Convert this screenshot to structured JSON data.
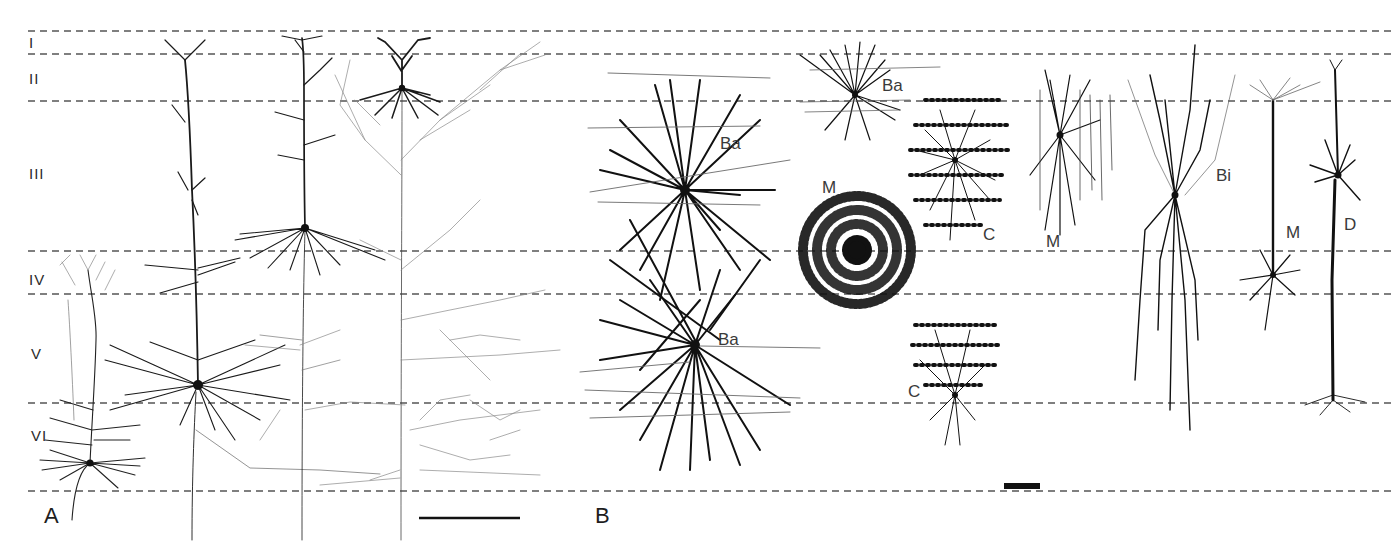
{
  "figure": {
    "layers": [
      {
        "label": "I",
        "top": 31,
        "bottom": 54
      },
      {
        "label": "II",
        "top": 54,
        "bottom": 101
      },
      {
        "label": "III",
        "top": 101,
        "bottom": 251
      },
      {
        "label": "IV",
        "top": 251,
        "bottom": 294
      },
      {
        "label": "V",
        "top": 294,
        "bottom": 403
      },
      {
        "label": "VI",
        "top": 403,
        "bottom": 491
      }
    ],
    "layer_boundaries_y": [
      31,
      54,
      101,
      251,
      294,
      403,
      491
    ],
    "panels": [
      {
        "label": "A",
        "content": "Pyramidal and spiny neurons spanning layers"
      },
      {
        "label": "B",
        "content": "Non-pyramidal interneuron types"
      }
    ],
    "cell_labels": [
      {
        "id": "ba-1",
        "text": "Ba",
        "x": 852,
        "y": 64
      },
      {
        "id": "ba-2",
        "text": "Ba",
        "x": 718,
        "y": 134
      },
      {
        "id": "ba-3",
        "text": "Ba",
        "x": 718,
        "y": 330
      },
      {
        "id": "m-1",
        "text": "M",
        "x": 822,
        "y": 178
      },
      {
        "id": "c-1",
        "text": "C",
        "x": 983,
        "y": 224
      },
      {
        "id": "m-2",
        "text": "M",
        "x": 1046,
        "y": 232
      },
      {
        "id": "bi-1",
        "text": "Bi",
        "x": 1216,
        "y": 166
      },
      {
        "id": "m-3",
        "text": "M",
        "x": 1286,
        "y": 223
      },
      {
        "id": "d-1",
        "text": "D",
        "x": 1344,
        "y": 215
      },
      {
        "id": "c-2",
        "text": "C",
        "x": 907,
        "y": 382
      }
    ],
    "scale_bars": [
      {
        "panel": "A",
        "x1": 419,
        "x2": 520,
        "y": 518
      },
      {
        "panel": "B",
        "x1": 1004,
        "x2": 1040,
        "y": 486
      }
    ],
    "colors": {
      "background": "#ffffff",
      "ink": "#1a1a1a",
      "dash": "#555555",
      "faint_axon": "#8a8a8a"
    }
  }
}
